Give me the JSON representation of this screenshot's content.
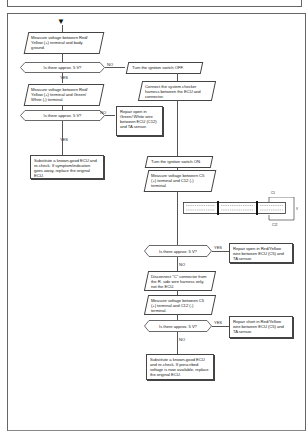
{
  "page": {
    "type": "troubleshooting-flowchart",
    "start_marker": "▼"
  },
  "flow": {
    "step1": "Measure voltage between Red/ Yellow (+) terminal and body ground.",
    "q1": "Is there approx. 5 V?",
    "q1_no_label": "NO",
    "q1_yes_label": "YES",
    "no_branch1": "Turn the ignition switch OFF.",
    "no_branch2": "Connect the system checker harness between the ECU and connector.",
    "step2": "Measure voltage between Red/ Yellow (+) terminal and Green/ White (-) terminal.",
    "q2": "Is there approx. 5 V?",
    "q2_no_label": "NO",
    "q2_yes_label": "YES",
    "q2_no_result": "Repair open in Green/ White wire between ECU (C12) and TA sensor.",
    "q2_yes_result": "Substitute a known-good ECU and re-check. If symptom/indication goes away, replace the original ECU.",
    "step3": "Turn the ignition switch ON.",
    "step4": "Measure voltage between C5 (+) terminal and C12 (-) terminal.",
    "connector_label_top": "C5",
    "connector_label_bottom": "C12",
    "connector_label_side": "V",
    "q3": "Is there approx. 5 V?",
    "q3_yes_label": "YES",
    "q3_no_label": "NO",
    "q3_yes_result": "Repair open in Red/Yellow wire between ECU (C5) and TA sensor.",
    "step5": "Disconnect \"C\" connector from the R. side wire harness only, not the ECU.",
    "step6": "Measure voltage between C5 (+) terminal and C12 (-) terminal.",
    "q4": "Is there approx. 5 V?",
    "q4_yes_label": "YES",
    "q4_no_label": "NO",
    "q4_yes_result": "Repair short in Red/Yellow wire between ECU (C5) and TA sensor.",
    "q4_no_result": "Substitute a known-good ECU and re-check. If prescribed voltage is now available, replace the original ECU."
  },
  "colors": {
    "line": "#555555",
    "background": "#ffffff",
    "text": "#222222"
  }
}
